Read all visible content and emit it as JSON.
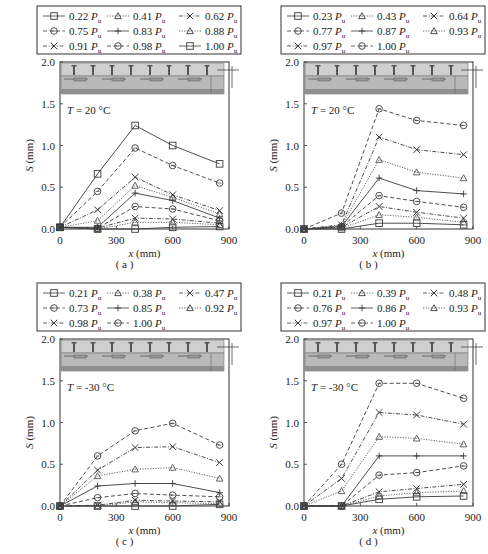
{
  "chart_data": [
    {
      "type": "line",
      "panel_label": "( a )",
      "annotation": "T = 20 °C",
      "xlabel": "x (mm)",
      "ylabel": "S (mm)",
      "xlim": [
        0,
        900
      ],
      "ylim": [
        0,
        2.0
      ],
      "xticks": [
        "0",
        "300",
        "600",
        "900"
      ],
      "yticks": [
        "0.0",
        "0.5",
        "1.0",
        "1.5",
        "2.0"
      ],
      "x": [
        0,
        200,
        400,
        600,
        850
      ],
      "legend_columns": 3,
      "series": [
        {
          "name": "0.22 Pu",
          "marker": "square",
          "dash": "solid",
          "values": [
            0.02,
            0.0,
            0.0,
            0.02,
            0.03
          ]
        },
        {
          "name": "0.41 Pu",
          "marker": "triangle",
          "dash": "dotted",
          "values": [
            0.02,
            0.0,
            0.08,
            0.08,
            0.05
          ]
        },
        {
          "name": "0.62 Pu",
          "marker": "x",
          "dash": "dashdot",
          "values": [
            0.02,
            0.01,
            0.13,
            0.12,
            0.07
          ]
        },
        {
          "name": "0.75 Pu",
          "marker": "circle",
          "dash": "dashed",
          "values": [
            0.02,
            0.01,
            0.27,
            0.24,
            0.1
          ]
        },
        {
          "name": "0.83 Pu",
          "marker": "plus",
          "dash": "solid",
          "values": [
            0.02,
            0.02,
            0.43,
            0.34,
            0.13
          ]
        },
        {
          "name": "0.88 Pu",
          "marker": "triangle",
          "dash": "dotted",
          "values": [
            0.02,
            0.1,
            0.52,
            0.38,
            0.18
          ]
        },
        {
          "name": "0.91 Pu",
          "marker": "x",
          "dash": "dashdot",
          "values": [
            0.02,
            0.23,
            0.62,
            0.41,
            0.22
          ]
        },
        {
          "name": "0.98 Pu",
          "marker": "circle",
          "dash": "dashed",
          "values": [
            0.02,
            0.45,
            0.97,
            0.76,
            0.55
          ]
        },
        {
          "name": "1.00 Pu",
          "marker": "square",
          "dash": "solid",
          "values": [
            0.02,
            0.66,
            1.24,
            1.0,
            0.78
          ]
        }
      ]
    },
    {
      "type": "line",
      "panel_label": "( b )",
      "annotation": "T = 20 °C",
      "xlabel": "x (mm)",
      "ylabel": "S (mm)",
      "xlim": [
        0,
        900
      ],
      "ylim": [
        0,
        2.0
      ],
      "xticks": [
        "0",
        "300",
        "600",
        "900"
      ],
      "yticks": [
        "0.0",
        "0.5",
        "1.0",
        "1.5",
        "2.0"
      ],
      "x": [
        0,
        200,
        400,
        600,
        850
      ],
      "legend_columns": 3,
      "series": [
        {
          "name": "0.23 Pu",
          "marker": "square",
          "dash": "solid",
          "values": [
            0.0,
            0.0,
            0.07,
            0.07,
            0.05
          ]
        },
        {
          "name": "0.43 Pu",
          "marker": "triangle",
          "dash": "dotted",
          "values": [
            0.0,
            0.01,
            0.17,
            0.14,
            0.08
          ]
        },
        {
          "name": "0.64 Pu",
          "marker": "x",
          "dash": "dashdot",
          "values": [
            0.0,
            0.02,
            0.27,
            0.2,
            0.13
          ]
        },
        {
          "name": "0.77 Pu",
          "marker": "circle",
          "dash": "dashed",
          "values": [
            0.0,
            0.03,
            0.4,
            0.33,
            0.26
          ]
        },
        {
          "name": "0.87 Pu",
          "marker": "plus",
          "dash": "solid",
          "values": [
            0.0,
            0.03,
            0.61,
            0.46,
            0.42
          ]
        },
        {
          "name": "0.93 Pu",
          "marker": "triangle",
          "dash": "dotted",
          "values": [
            0.0,
            0.04,
            0.83,
            0.68,
            0.61
          ]
        },
        {
          "name": "0.97 Pu",
          "marker": "x",
          "dash": "dashdot",
          "values": [
            0.0,
            0.05,
            1.1,
            0.95,
            0.89
          ]
        },
        {
          "name": "1.00 Pu",
          "marker": "circle",
          "dash": "dashed",
          "values": [
            0.0,
            0.19,
            1.44,
            1.3,
            1.24
          ]
        }
      ]
    },
    {
      "type": "line",
      "panel_label": "( c )",
      "annotation": "T = -30 °C",
      "xlabel": "x (mm)",
      "ylabel": "S (mm)",
      "xlim": [
        0,
        900
      ],
      "ylim": [
        0,
        2.0
      ],
      "xticks": [
        "0",
        "300",
        "600",
        "900"
      ],
      "yticks": [
        "0.0",
        "0.5",
        "1.0",
        "1.5",
        "2.0"
      ],
      "x": [
        0,
        200,
        400,
        600,
        850
      ],
      "legend_columns": 3,
      "series": [
        {
          "name": "0.21 Pu",
          "marker": "square",
          "dash": "solid",
          "values": [
            0.0,
            0.0,
            0.0,
            0.0,
            0.02
          ]
        },
        {
          "name": "0.38 Pu",
          "marker": "triangle",
          "dash": "dotted",
          "values": [
            0.0,
            0.0,
            0.05,
            0.04,
            0.03
          ]
        },
        {
          "name": "0.47 Pu",
          "marker": "x",
          "dash": "dashdot",
          "values": [
            0.0,
            0.01,
            0.07,
            0.06,
            0.05
          ]
        },
        {
          "name": "0.73 Pu",
          "marker": "circle",
          "dash": "dashed",
          "values": [
            0.0,
            0.1,
            0.15,
            0.13,
            0.11
          ]
        },
        {
          "name": "0.85 Pu",
          "marker": "plus",
          "dash": "solid",
          "values": [
            0.0,
            0.24,
            0.27,
            0.27,
            0.16
          ]
        },
        {
          "name": "0.92 Pu",
          "marker": "triangle",
          "dash": "dotted",
          "values": [
            0.0,
            0.36,
            0.44,
            0.46,
            0.33
          ]
        },
        {
          "name": "0.98 Pu",
          "marker": "x",
          "dash": "dashdot",
          "values": [
            0.0,
            0.43,
            0.7,
            0.71,
            0.52
          ]
        },
        {
          "name": "1.00 Pu",
          "marker": "circle",
          "dash": "dashed",
          "values": [
            0.0,
            0.6,
            0.9,
            0.99,
            0.73
          ]
        }
      ]
    },
    {
      "type": "line",
      "panel_label": "( d )",
      "annotation": "T = -30 °C",
      "xlabel": "x (mm)",
      "ylabel": "S (mm)",
      "xlim": [
        0,
        900
      ],
      "ylim": [
        0,
        2.0
      ],
      "xticks": [
        "0",
        "300",
        "600",
        "900"
      ],
      "yticks": [
        "0.0",
        "0.5",
        "1.0",
        "1.5",
        "2.0"
      ],
      "x": [
        0,
        200,
        400,
        600,
        850
      ],
      "legend_columns": 3,
      "series": [
        {
          "name": "0.21 Pu",
          "marker": "square",
          "dash": "solid",
          "values": [
            0.0,
            0.0,
            0.08,
            0.11,
            0.12
          ]
        },
        {
          "name": "0.39 Pu",
          "marker": "triangle",
          "dash": "dotted",
          "values": [
            0.0,
            0.0,
            0.12,
            0.16,
            0.18
          ]
        },
        {
          "name": "0.48 Pu",
          "marker": "x",
          "dash": "dashdot",
          "values": [
            0.0,
            0.0,
            0.17,
            0.21,
            0.26
          ]
        },
        {
          "name": "0.76 Pu",
          "marker": "circle",
          "dash": "dashed",
          "values": [
            0.0,
            0.0,
            0.37,
            0.4,
            0.48
          ]
        },
        {
          "name": "0.86 Pu",
          "marker": "plus",
          "dash": "solid",
          "values": [
            0.0,
            0.0,
            0.6,
            0.6,
            0.6
          ]
        },
        {
          "name": "0.93 Pu",
          "marker": "triangle",
          "dash": "dotted",
          "values": [
            0.0,
            0.18,
            0.83,
            0.81,
            0.74
          ]
        },
        {
          "name": "0.97 Pu",
          "marker": "x",
          "dash": "dashdot",
          "values": [
            0.0,
            0.33,
            1.12,
            1.09,
            0.98
          ]
        },
        {
          "name": "1.00 Pu",
          "marker": "circle",
          "dash": "dashed",
          "values": [
            0.0,
            0.5,
            1.47,
            1.47,
            1.29
          ]
        }
      ]
    }
  ],
  "style": {
    "line_color": "#3a3a3a",
    "light_line_color": "#8a8a8a",
    "frame_color": "#333333",
    "beam_fill": "#b9b9b9",
    "beam_dark": "#8f8f8f"
  }
}
